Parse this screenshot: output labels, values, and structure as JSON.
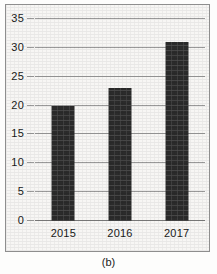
{
  "figure": {
    "caption": "(b)",
    "background_color": "#f7f6f4",
    "frame_color": "#8e8e8e"
  },
  "chart_data": {
    "type": "bar",
    "title": "",
    "subtitle": "",
    "xlabel": "",
    "ylabel": "",
    "categories": [
      "2015",
      "2016",
      "2017"
    ],
    "values": [
      20,
      23,
      31
    ],
    "ylim": [
      0,
      35
    ],
    "ytick_step": 5,
    "yticks": [
      0,
      5,
      10,
      15,
      20,
      25,
      30,
      35
    ],
    "ytick_labels": [
      "0",
      "5",
      "10",
      "15",
      "20",
      "25",
      "30",
      "35"
    ],
    "grid": true,
    "grid_axis": "y",
    "grid_color": "#9a9a9a",
    "legend": false,
    "legend_position": "none",
    "bar_color": "#2b2b2b",
    "annotations": []
  }
}
